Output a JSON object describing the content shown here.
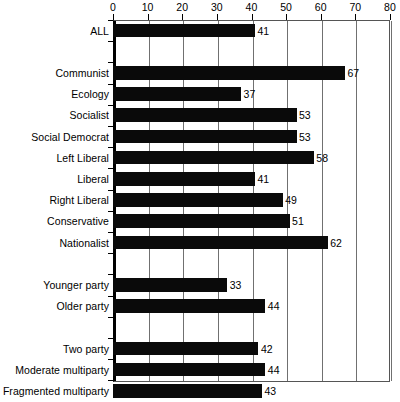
{
  "chart_data": {
    "type": "bar",
    "orientation": "horizontal",
    "title": "",
    "xlabel": "",
    "ylabel": "",
    "xlim": [
      0,
      80
    ],
    "xticks": [
      0,
      10,
      20,
      30,
      40,
      50,
      60,
      70,
      80
    ],
    "grid": true,
    "legend": false,
    "bar_color": "#0a0a0a",
    "value_labels": true,
    "groups": [
      {
        "name": "overall",
        "categories": [
          "ALL"
        ],
        "values": [
          41
        ]
      },
      {
        "name": "party-family",
        "categories": [
          "Communist",
          "Ecology",
          "Socialist",
          "Social Democrat",
          "Left Liberal",
          "Liberal",
          "Right Liberal",
          "Conservative",
          "Nationalist"
        ],
        "values": [
          67,
          37,
          53,
          53,
          58,
          41,
          49,
          51,
          62
        ]
      },
      {
        "name": "party-age",
        "categories": [
          "Younger party",
          "Older party"
        ],
        "values": [
          33,
          44
        ]
      },
      {
        "name": "party-system",
        "categories": [
          "Two party",
          "Moderate multiparty",
          "Fragmented multiparty"
        ],
        "values": [
          42,
          44,
          43
        ]
      }
    ],
    "categories": [
      "ALL",
      "Communist",
      "Ecology",
      "Socialist",
      "Social Democrat",
      "Left Liberal",
      "Liberal",
      "Right Liberal",
      "Conservative",
      "Nationalist",
      "Younger party",
      "Older party",
      "Two party",
      "Moderate multiparty",
      "Fragmented multiparty"
    ],
    "values": [
      41,
      67,
      37,
      53,
      53,
      58,
      41,
      49,
      51,
      62,
      33,
      44,
      42,
      44,
      43
    ]
  },
  "axis": {
    "tick_labels": [
      "0",
      "10",
      "20",
      "30",
      "40",
      "50",
      "60",
      "70",
      "80"
    ]
  },
  "rows": [
    {
      "label": "ALL",
      "value": 41,
      "spacer": false
    },
    {
      "label": "",
      "value": null,
      "spacer": true
    },
    {
      "label": "Communist",
      "value": 67,
      "spacer": false
    },
    {
      "label": "Ecology",
      "value": 37,
      "spacer": false
    },
    {
      "label": "Socialist",
      "value": 53,
      "spacer": false
    },
    {
      "label": "Social Democrat",
      "value": 53,
      "spacer": false
    },
    {
      "label": "Left Liberal",
      "value": 58,
      "spacer": false
    },
    {
      "label": "Liberal",
      "value": 41,
      "spacer": false
    },
    {
      "label": "Right Liberal",
      "value": 49,
      "spacer": false
    },
    {
      "label": "Conservative",
      "value": 51,
      "spacer": false
    },
    {
      "label": "Nationalist",
      "value": 62,
      "spacer": false
    },
    {
      "label": "",
      "value": null,
      "spacer": true
    },
    {
      "label": "Younger party",
      "value": 33,
      "spacer": false
    },
    {
      "label": "Older party",
      "value": 44,
      "spacer": false
    },
    {
      "label": "",
      "value": null,
      "spacer": true
    },
    {
      "label": "Two party",
      "value": 42,
      "spacer": false
    },
    {
      "label": "Moderate multiparty",
      "value": 44,
      "spacer": false
    },
    {
      "label": "Fragmented multiparty",
      "value": 43,
      "spacer": false
    }
  ]
}
